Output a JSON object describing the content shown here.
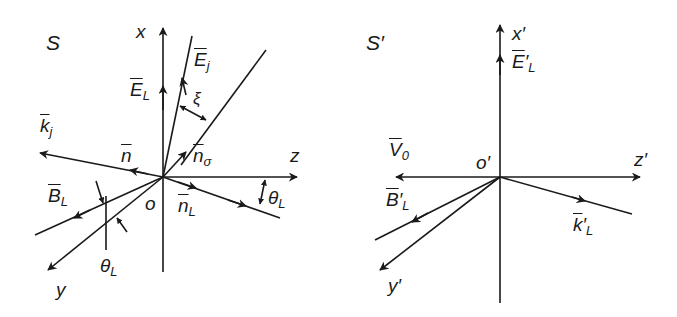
{
  "colors": {
    "ink": "#1a1a1a",
    "background": "#ffffff"
  },
  "frame_S": {
    "title": "S",
    "labels": {
      "x": "x",
      "z": "z",
      "y": "y",
      "o": "o",
      "E_L": "E",
      "E_L_sub": "L",
      "E_j": "E",
      "E_j_sub": "j",
      "xi": "ξ",
      "k_j": "k",
      "k_j_sub": "j",
      "n": "n",
      "n_sigma": "n",
      "n_sigma_sub": "σ",
      "n_L": "n",
      "n_L_sub": "L",
      "B_L": "B",
      "B_L_sub": "L",
      "theta_L_right": "θ",
      "theta_L_right_sub": "L",
      "theta_L_left": "θ",
      "theta_L_left_sub": "L"
    }
  },
  "frame_S_prime": {
    "title": "S′",
    "labels": {
      "x": "x′",
      "z": "z′",
      "y": "y′",
      "o": "o′",
      "E_L": "E",
      "E_L_sub": "L",
      "E_L_prime": "′",
      "V0": "V",
      "V0_sub": "0",
      "B_L": "B",
      "B_L_sub": "L",
      "B_L_prime": "′",
      "k_L": "k",
      "k_L_sub": "L",
      "k_L_prime": "′"
    }
  }
}
